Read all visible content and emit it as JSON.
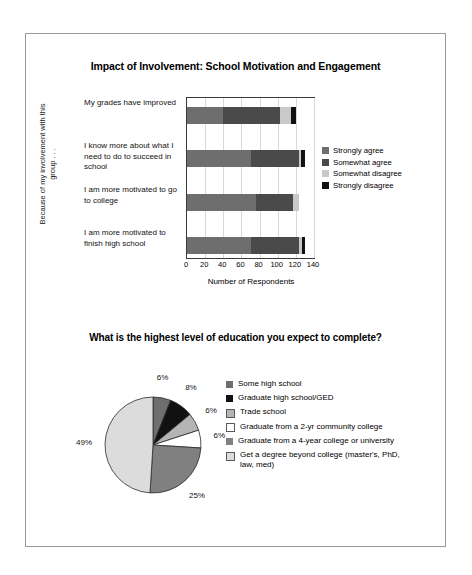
{
  "colors": {
    "strongly_agree": "#6e6e6e",
    "somewhat_agree": "#4a4a4a",
    "somewhat_disagree": "#c9c9c9",
    "strongly_disagree": "#111111",
    "pie_some_high_school": "#6e6e6e",
    "pie_graduate_hs_ged": "#111111",
    "pie_trade_school": "#b4b4b4",
    "pie_two_year": "#ffffff",
    "pie_four_year": "#808080",
    "pie_beyond_college": "#dcdcdc",
    "frame_border": "#9a9a9a",
    "plot_border": "#3a3a3a",
    "gridline": "#d8d8d8"
  },
  "bar_chart": {
    "title": "Impact of Involvement: School Motivation and Engagement",
    "ylabel": "Because of my involvement with this group . . .",
    "xlabel": "Number of Respondents"
  },
  "pie_chart": {
    "title": "What is the highest level of education you expect to complete?"
  },
  "chart_data": [
    {
      "type": "bar",
      "title": "Impact of Involvement: School Motivation and Engagement",
      "xlabel": "Number of Respondents",
      "ylabel": "Because of my involvement with this group . . .",
      "orientation": "horizontal",
      "stacked": true,
      "grid": true,
      "legend_position": "right",
      "xlim": [
        0,
        140
      ],
      "xticks": [
        0,
        20,
        40,
        60,
        80,
        100,
        120,
        140
      ],
      "categories": [
        "My grades have improved",
        "I know more about what I need to do to succeed in school",
        "I am more motivated to go to college",
        "I am more motivated to finish high school"
      ],
      "series": [
        {
          "name": "Strongly agree",
          "values": [
            40,
            70,
            76,
            70
          ]
        },
        {
          "name": "Somewhat agree",
          "values": [
            62,
            53,
            41,
            54
          ]
        },
        {
          "name": "Somewhat disagree",
          "values": [
            13,
            3,
            6,
            3
          ]
        },
        {
          "name": "Strongly disagree",
          "values": [
            5,
            4,
            0,
            3
          ]
        }
      ]
    },
    {
      "type": "pie",
      "title": "What is the highest level of education you expect to complete?",
      "legend_position": "right",
      "start_angle_deg": 0,
      "direction": "clockwise",
      "labels": [
        "Some high school",
        "Graduate high school/GED",
        "Trade school",
        "Graduate from a 2-yr community college",
        "Graduate from a 4-year college or university",
        "Get a degree beyond college (master's, PhD, law, med)"
      ],
      "values": [
        6,
        8,
        6,
        6,
        25,
        49
      ],
      "value_labels": [
        "6%",
        "8%",
        "6%",
        "6%",
        "25%",
        "49%"
      ]
    }
  ],
  "bar_legend": [
    {
      "label": "Strongly agree",
      "color": "#6e6e6e"
    },
    {
      "label": "Somewhat agree",
      "color": "#4a4a4a"
    },
    {
      "label": "Somewhat disagree",
      "color": "#c9c9c9"
    },
    {
      "label": "Strongly disagree",
      "color": "#111111"
    }
  ],
  "pie_legend": [
    {
      "label": "Some high school",
      "color": "#6e6e6e",
      "border": false
    },
    {
      "label": "Graduate high school/GED",
      "color": "#111111",
      "border": false
    },
    {
      "label": "Trade school",
      "color": "#b4b4b4",
      "border": true
    },
    {
      "label": "Graduate from a 2-yr community college",
      "color": "#ffffff",
      "border": true
    },
    {
      "label": "Graduate from a 4-year college or university",
      "color": "#808080",
      "border": false
    },
    {
      "label": "Get a degree beyond college (master's, PhD, law, med)",
      "color": "#dcdcdc",
      "border": true
    }
  ]
}
